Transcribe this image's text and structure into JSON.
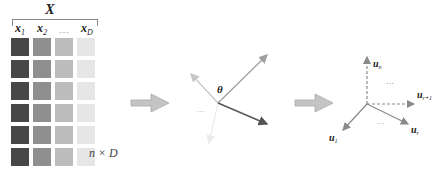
{
  "matrix": {
    "title": "X",
    "columns": [
      {
        "base": "x",
        "sub": "1"
      },
      {
        "base": "x",
        "sub": "2"
      },
      {
        "base": "…",
        "sub": ""
      },
      {
        "base": "x",
        "sub": "D"
      }
    ],
    "column_colors": [
      "#474747",
      "#8f8f8f",
      "#bcbcbc",
      "#e6e6e6"
    ],
    "row_count": 6,
    "dimension_label": "n × D"
  },
  "arrows": {
    "fill_color": "#c0c0c0",
    "stroke_color": "#9a9a9a"
  },
  "vector_panel": {
    "angle_label": "θ",
    "ellipsis": "…",
    "vector_colors": [
      "#a0a0a0",
      "#c8c8c8",
      "#e8e8e8",
      "#555555"
    ]
  },
  "basis_panel": {
    "labels": {
      "u_n": {
        "base": "u",
        "sub": "n"
      },
      "u_r1": {
        "base": "u",
        "sub": "r+1"
      },
      "u_r": {
        "base": "u",
        "sub": "r"
      },
      "u_1": {
        "base": "u",
        "sub": "1"
      }
    },
    "ellipsis_top": "…",
    "ellipsis_bottom": "…",
    "line_color": "#8a8a8a"
  }
}
